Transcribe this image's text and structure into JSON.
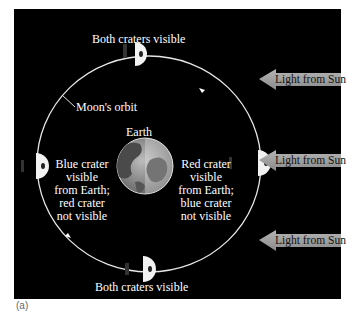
{
  "figure": {
    "caption": "(a)",
    "top_cut_text": "Moon's orbit",
    "labels": {
      "top_moon": "Both craters visible",
      "bottom_moon": "Both craters visible",
      "orbit": "Moon's orbit",
      "earth": "Earth",
      "left_moon": [
        "Blue crater",
        "visible",
        "from Earth;",
        "red crater",
        "not visible"
      ],
      "right_moon": [
        "Red crater",
        "visible",
        "from Earth;",
        "blue crater",
        "not visible"
      ]
    },
    "sun_arrows": [
      {
        "label": "Light from Sun"
      },
      {
        "label": "Light from Sun"
      },
      {
        "label": "Light from Sun"
      }
    ],
    "colors": {
      "background": "#000000",
      "orbit": "#e6e6e6",
      "arrow_fill": "#9a9a9a",
      "moon_lit": "#f2f2f2",
      "moon_dark": "#111111"
    }
  }
}
